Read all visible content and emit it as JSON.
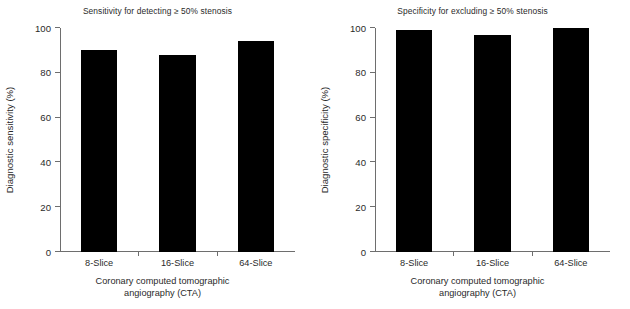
{
  "figure": {
    "background": "#ffffff",
    "bar_color": "#000000",
    "axis_color": "#6e6e6e",
    "text_color": "#2a2a2a"
  },
  "chart_data": [
    {
      "type": "bar",
      "title": "Sensitivity for detecting ≥ 50% stenosis",
      "xlabel_line1": "Coronary computed tomographic",
      "xlabel_line2": "angiography (CTA)",
      "ylabel": "Diagnostic sensitivity (%)",
      "categories": [
        "8-Slice",
        "16-Slice",
        "64-Slice"
      ],
      "values": [
        90,
        88,
        94
      ],
      "ylim": [
        0,
        100
      ],
      "yticks": [
        0,
        20,
        40,
        60,
        80,
        100
      ],
      "ytick_labels": [
        "0",
        "20",
        "40",
        "60",
        "80",
        "100"
      ],
      "grid": false,
      "legend": "none"
    },
    {
      "type": "bar",
      "title": "Specificity for excluding ≥ 50% stenosis",
      "xlabel_line1": "Coronary computed tomographic",
      "xlabel_line2": "angiography (CTA)",
      "ylabel": "Diagnostic specificity (%)",
      "categories": [
        "8-Slice",
        "16-Slice",
        "64-Slice"
      ],
      "values": [
        99,
        97,
        100
      ],
      "ylim": [
        0,
        100
      ],
      "yticks": [
        0,
        20,
        40,
        60,
        80,
        100
      ],
      "ytick_labels": [
        "0",
        "20",
        "40",
        "60",
        "80",
        "100"
      ],
      "grid": false,
      "legend": "none"
    }
  ]
}
